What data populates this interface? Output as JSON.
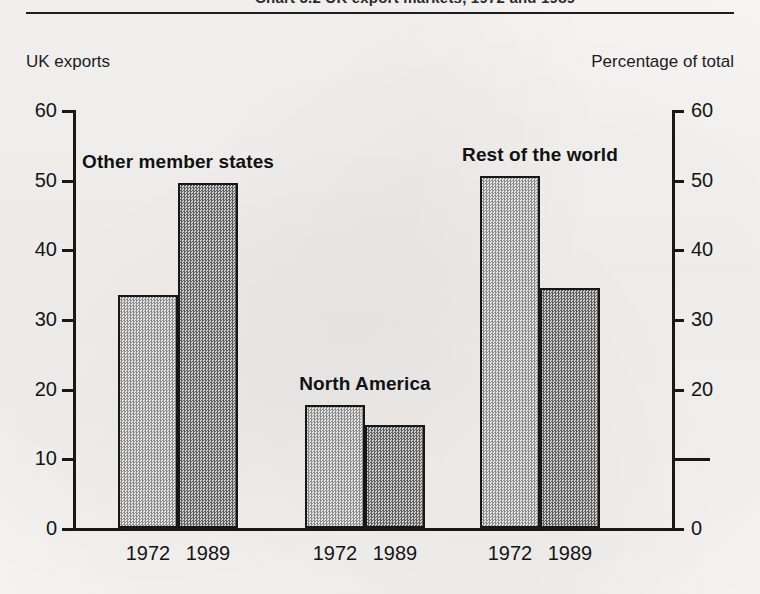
{
  "header": {
    "clipped_title": "Chart 5.2 UK export markets, 1972 and 1989",
    "caption_left": "UK exports",
    "caption_right": "Percentage of total"
  },
  "chart_data": {
    "type": "bar",
    "title": "UK exports",
    "subtitle": "Percentage of total",
    "xlabel": "",
    "ylabel": "Percentage of total",
    "ylim": [
      0,
      60
    ],
    "yticks": [
      0,
      10,
      20,
      30,
      40,
      50,
      60
    ],
    "ytick_labels_left": [
      "0",
      "10",
      "20",
      "30",
      "40",
      "50",
      "60"
    ],
    "ytick_labels_right": [
      "0",
      "",
      "20",
      "30",
      "40",
      "50",
      "60"
    ],
    "grid": false,
    "legend": "none",
    "dual_axis": true,
    "categories": [
      "Other member states",
      "North America",
      "Rest of the world"
    ],
    "series": [
      {
        "name": "1972",
        "values": [
          33.5,
          17.7,
          50.5
        ]
      },
      {
        "name": "1989",
        "values": [
          49.5,
          14.8,
          34.5
        ]
      }
    ],
    "groups": [
      {
        "label": "Other member states",
        "bars": [
          {
            "year": "1972",
            "value": 33.5
          },
          {
            "year": "1989",
            "value": 49.5
          }
        ]
      },
      {
        "label": "North America",
        "bars": [
          {
            "year": "1972",
            "value": 17.7
          },
          {
            "year": "1989",
            "value": 14.8
          }
        ]
      },
      {
        "label": "Rest of the world",
        "bars": [
          {
            "year": "1972",
            "value": 50.5
          },
          {
            "year": "1989",
            "value": 34.5
          }
        ]
      }
    ]
  },
  "colors": {
    "paper": "#f4f3f1",
    "ink": "#171717",
    "bar_1972": "#dcdcdc",
    "bar_1989": "#bdbdbd"
  }
}
